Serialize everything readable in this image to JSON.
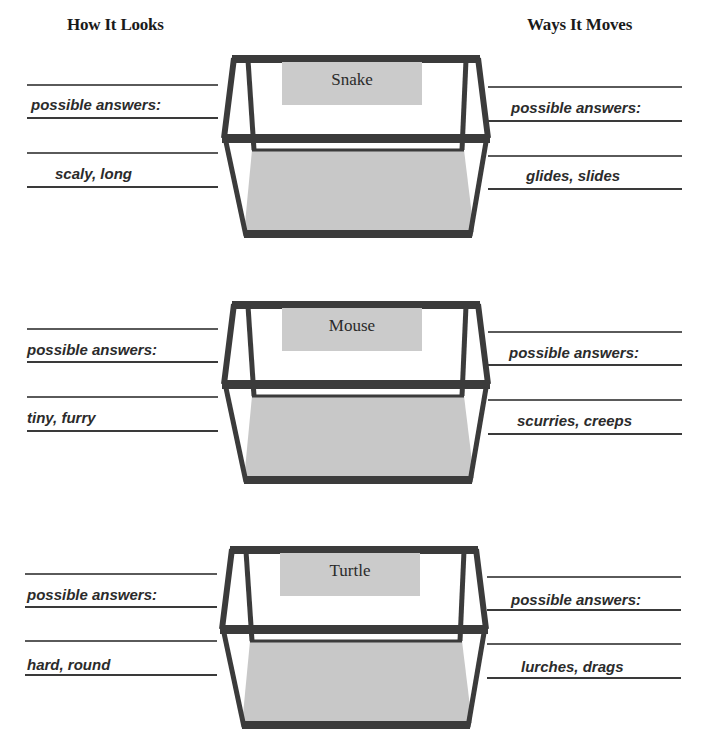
{
  "headings": {
    "left": "How It Looks",
    "right": "Ways It Moves"
  },
  "sections": [
    {
      "animal": "Snake",
      "looks": {
        "prompt": "possible answers:",
        "answer": "scaly, long"
      },
      "moves": {
        "prompt": "possible answers:",
        "answer": "glides, slides"
      }
    },
    {
      "animal": "Mouse",
      "looks": {
        "prompt": "possible answers:",
        "answer": "tiny, furry"
      },
      "moves": {
        "prompt": "possible answers:",
        "answer": "scurries, creeps"
      }
    },
    {
      "animal": "Turtle",
      "looks": {
        "prompt": "possible answers:",
        "answer": "hard, round"
      },
      "moves": {
        "prompt": "possible answers:",
        "answer": "lurches, drags"
      }
    }
  ],
  "colors": {
    "frame": "#3b3b3b",
    "floor": "#c8c8c8",
    "label_box": "#cbcbcb",
    "rule": "#3a3a3a",
    "text": "#2b2b2b"
  }
}
